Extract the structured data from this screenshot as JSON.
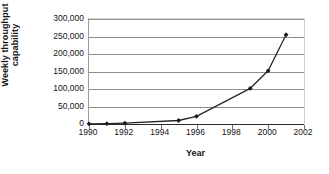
{
  "chart_data": {
    "type": "line",
    "title": "",
    "xlabel": "Year",
    "ylabel_lines": [
      "Weekly throughput",
      "capability"
    ],
    "ylabel": "Weekly throughput capability",
    "x": [
      1990,
      1991,
      1992,
      1995,
      1996,
      1999,
      2000,
      2001
    ],
    "values": [
      500,
      1000,
      2500,
      10000,
      22000,
      102000,
      152000,
      255000
    ],
    "series": [
      {
        "name": "Weekly throughput capability",
        "values": [
          500,
          1000,
          2500,
          10000,
          22000,
          102000,
          152000,
          255000
        ]
      }
    ],
    "xlim": [
      1990,
      2002
    ],
    "ylim": [
      0,
      300000
    ],
    "xticks": [
      1990,
      1992,
      1994,
      1996,
      1998,
      2000,
      2002
    ],
    "xtick_labels": [
      "1990",
      "1992",
      "1994",
      "1996",
      "1998",
      "2000",
      "2002"
    ],
    "yticks": [
      0,
      50000,
      100000,
      150000,
      200000,
      250000,
      300000
    ],
    "ytick_labels": [
      "0",
      "50,000",
      "100,000",
      "150,000",
      "200,000",
      "250,000",
      "300,000"
    ],
    "grid": "horizontal",
    "legend": "none",
    "line_color": "#262626",
    "marker": "diamond",
    "marker_color": "#1a1a1a",
    "gridline_color": "#8f8f8f",
    "background": "#ffffff"
  }
}
